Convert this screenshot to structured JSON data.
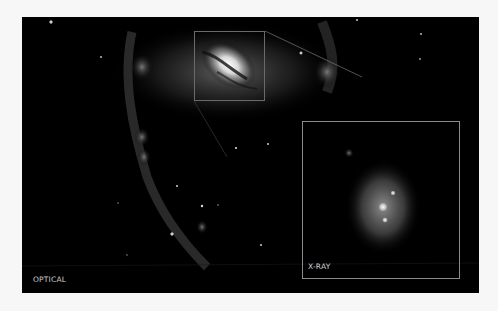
{
  "figure": {
    "main_panel_label": "OPTICAL",
    "inset_panel_label": "X-RAY",
    "background_color": "#000000",
    "page_background": "#f7f7f7",
    "label_color": "#cfcfcf",
    "inset_border_color": "#8a8a8a"
  }
}
